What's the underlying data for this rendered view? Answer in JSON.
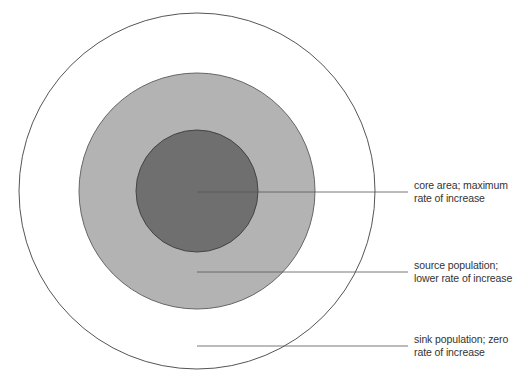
{
  "diagram": {
    "type": "concentric-zones",
    "zones": [
      {
        "id": "sink",
        "lines": [
          "sink population; zero",
          "rate of increase"
        ],
        "fill": "#ffffff",
        "stroke": "#555555"
      },
      {
        "id": "source",
        "lines": [
          "source population;",
          "lower rate of increase"
        ],
        "fill": "#b3b3b3",
        "stroke": "#666666"
      },
      {
        "id": "core",
        "lines": [
          "core area; maximum",
          "rate of increase"
        ],
        "fill": "#6f6f6f",
        "stroke": "#444444"
      }
    ],
    "leader_color": "#555555"
  }
}
